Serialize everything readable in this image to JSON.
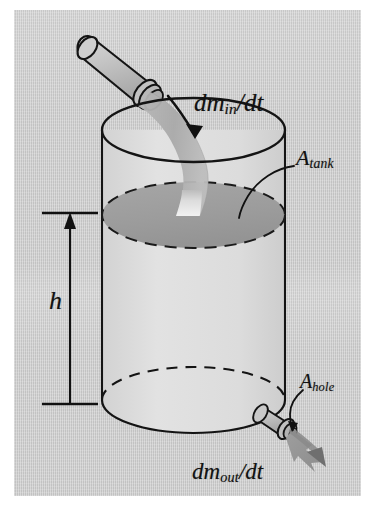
{
  "figure": {
    "kind": "physics-diagram",
    "background_color": "#c9c9c9",
    "ink_color": "#111111",
    "water_color": "#9a9a9a",
    "stream_color": "#b0b0b0"
  },
  "labels": {
    "inflow": {
      "base": "dm",
      "sub": "in",
      "tail": "/dt",
      "full": "dm_in/dt"
    },
    "outflow": {
      "base": "dm",
      "sub": "out",
      "tail": "/dt",
      "full": "dm_out/dt"
    },
    "tank_area": {
      "base": "A",
      "sub": "tank",
      "tail": "",
      "full": "A_tank"
    },
    "hole_area": {
      "base": "A",
      "sub": "hole",
      "tail": "",
      "full": "A_hole"
    },
    "height": {
      "base": "h",
      "sub": "",
      "tail": "",
      "full": "h"
    }
  },
  "parts": {
    "inlet_pipe": "inlet-pipe",
    "water_stream": "water-stream",
    "tank_body": "tank-cylinder",
    "tank_rim": "tank-top-rim",
    "water_surface": "water-surface-ellipse",
    "tank_bottom": "tank-bottom-ellipse",
    "outlet_nozzle": "outlet-nozzle",
    "outflow_arrow": "outflow-arrow",
    "inflow_arrow": "inflow-arrow",
    "height_dimension": "height-dimension-line",
    "tank_leader": "tank-area-leader-line",
    "hole_leader": "hole-area-leader-line"
  }
}
